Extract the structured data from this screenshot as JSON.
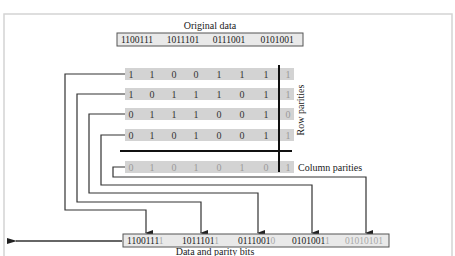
{
  "colors": {
    "row_fill": "#d3d3d3",
    "box_fill": "#e9e9e9",
    "parity_text": "#9a9a9a",
    "line": "#333333"
  },
  "labels": {
    "original_data": "Original data",
    "row_parities": "Row parities",
    "column_parities": "Column parities",
    "data_and_parity": "Data and parity bits"
  },
  "original_data": [
    "1100111",
    "1011101",
    "0111001",
    "0101001"
  ],
  "matrix": {
    "rows": [
      {
        "bits": [
          "1",
          "1",
          "0",
          "0",
          "1",
          "1",
          "1"
        ],
        "parity": "1"
      },
      {
        "bits": [
          "1",
          "0",
          "1",
          "1",
          "1",
          "0",
          "1"
        ],
        "parity": "1"
      },
      {
        "bits": [
          "0",
          "1",
          "1",
          "1",
          "0",
          "0",
          "1"
        ],
        "parity": "0"
      },
      {
        "bits": [
          "0",
          "1",
          "0",
          "1",
          "0",
          "0",
          "1"
        ],
        "parity": "1"
      }
    ],
    "column_parity": {
      "bits": [
        "0",
        "1",
        "0",
        "1",
        "0",
        "1",
        "0"
      ],
      "parity": "1"
    }
  },
  "output": [
    {
      "data": "1100111",
      "parity": "1"
    },
    {
      "data": "1011101",
      "parity": "1"
    },
    {
      "data": "0111001",
      "parity": "0"
    },
    {
      "data": "0101001",
      "parity": "1"
    },
    {
      "data": "",
      "parity": "01010101"
    }
  ]
}
